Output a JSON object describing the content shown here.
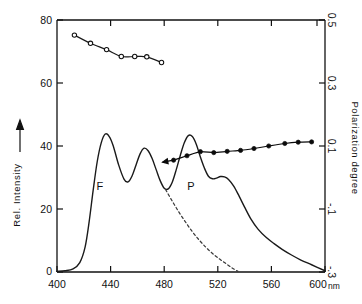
{
  "chart_data": {
    "type": "line",
    "title": "",
    "xlabel": "nm",
    "x_unit": "nm",
    "ylabel_left": "Rel. Intensity",
    "ylabel_right": "Polarization degree",
    "xlim": [
      400,
      600
    ],
    "ylim_left": [
      0,
      80
    ],
    "ylim_right": [
      -0.3,
      0.5
    ],
    "grid": false,
    "legend": "none",
    "x_ticks": [
      400,
      440,
      480,
      520,
      560,
      600
    ],
    "x_tick_labels": [
      "400",
      "440",
      "480",
      "520",
      "560",
      "600"
    ],
    "y_ticks_left": [
      0,
      20,
      40,
      60,
      80
    ],
    "y_tick_labels_left": [
      "0",
      "20",
      "40",
      "60",
      "80"
    ],
    "y_ticks_right": [
      -0.3,
      -0.1,
      0.1,
      0.3,
      0.5
    ],
    "y_tick_labels_right": [
      "-.3",
      "-.1",
      "0.1",
      "0.3",
      "0.5"
    ],
    "annotations": [
      {
        "text": "F",
        "x": 432,
        "y_left": 26,
        "name": "fluorescence-label"
      },
      {
        "text": "P",
        "x": 500,
        "y_left": 26,
        "name": "phosphorescence-label"
      }
    ],
    "series": [
      {
        "name": "emission-spectrum",
        "label": "",
        "axis": "left",
        "style": "solid",
        "marker": "none",
        "color": "#1a1a1a",
        "x": [
          400,
          406,
          412,
          417,
          421,
          424,
          427,
          430,
          433,
          436,
          439,
          442,
          446,
          450,
          453,
          456,
          459,
          462,
          465,
          468,
          471,
          474,
          477,
          480,
          483,
          486,
          489,
          492,
          495,
          498,
          501,
          504,
          507,
          510,
          513,
          516,
          519,
          522,
          525,
          528,
          532,
          536,
          540,
          545,
          550,
          556,
          562,
          568,
          575,
          582,
          590,
          600
        ],
        "y": [
          0.2,
          0.4,
          1.0,
          3.0,
          8.0,
          16.0,
          26.0,
          35.0,
          41.0,
          43.8,
          43.0,
          40.0,
          34.0,
          29.5,
          28.6,
          30.5,
          34.0,
          37.5,
          39.3,
          38.5,
          36.0,
          32.5,
          29.0,
          26.6,
          26.4,
          28.5,
          32.5,
          37.0,
          41.0,
          43.3,
          43.0,
          40.5,
          36.5,
          33.0,
          30.4,
          29.6,
          29.8,
          30.3,
          30.2,
          29.4,
          27.2,
          24.0,
          20.6,
          16.6,
          13.6,
          11.0,
          9.0,
          7.2,
          5.4,
          3.8,
          2.3,
          0.4
        ]
      },
      {
        "name": "fluorescence-component",
        "label": "",
        "axis": "left",
        "style": "dashed",
        "marker": "none",
        "color": "#3a3a3a",
        "x": [
          481,
          486,
          491,
          496,
          501,
          506,
          511,
          516,
          521,
          526,
          531,
          535
        ],
        "y": [
          26.2,
          22.5,
          19.0,
          15.8,
          12.8,
          10.2,
          7.9,
          5.9,
          4.2,
          2.7,
          1.2,
          0.2
        ]
      },
      {
        "name": "polarization-excitation",
        "label": "",
        "axis": "right",
        "style": "solid",
        "marker": "open-circle",
        "color": "#1a1a1a",
        "x": [
          413,
          425,
          437,
          448,
          458,
          467,
          478
        ],
        "y": [
          0.452,
          0.426,
          0.406,
          0.384,
          0.384,
          0.383,
          0.365
        ]
      },
      {
        "name": "polarization-emission",
        "label": "",
        "axis": "right",
        "style": "solid",
        "marker": "filled-circle",
        "color": "#0a0a0a",
        "x": [
          487,
          497,
          507,
          517,
          527,
          537,
          547,
          558,
          570,
          580,
          590
        ],
        "y": [
          0.055,
          0.069,
          0.082,
          0.079,
          0.083,
          0.086,
          0.092,
          0.1,
          0.108,
          0.112,
          0.113
        ],
        "has_left_arrow": true
      }
    ]
  }
}
